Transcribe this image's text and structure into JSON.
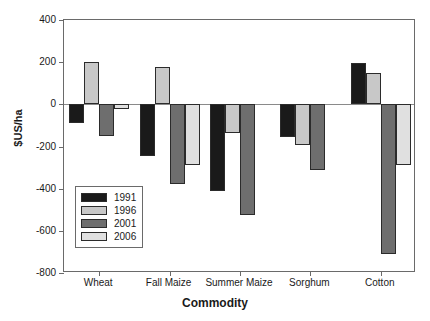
{
  "chart_data": {
    "type": "bar",
    "title": "",
    "xlabel": "Commodity",
    "ylabel": "$US/ha",
    "ylim": [
      -800,
      400
    ],
    "yticks": [
      400,
      200,
      0,
      -200,
      -400,
      -600,
      -800
    ],
    "ytick_labels": [
      "400",
      "200",
      "0",
      "-200",
      "-400",
      "-600",
      "-800"
    ],
    "grid": false,
    "legend_position": "inside-lower-left",
    "categories": [
      "Wheat",
      "Fall Maize",
      "Summer Maize",
      "Sorghum",
      "Cotton"
    ],
    "series": [
      {
        "name": "1991",
        "color": "#1a1a1a",
        "values": [
          -90,
          -245,
          -410,
          -155,
          195
        ]
      },
      {
        "name": "1996",
        "color": "#c8c8c8",
        "values": [
          200,
          175,
          -135,
          -195,
          150
        ]
      },
      {
        "name": "2001",
        "color": "#6e6e6e",
        "values": [
          -150,
          -380,
          -525,
          -310,
          -710
        ]
      },
      {
        "name": "2006",
        "color": "#e0e0e0",
        "values": [
          -20,
          -290,
          0,
          0,
          -290
        ]
      }
    ]
  },
  "legend": {
    "entries": [
      {
        "label": "1991"
      },
      {
        "label": "1996"
      },
      {
        "label": "2001"
      },
      {
        "label": "2006"
      }
    ]
  },
  "colors": {
    "axis": "#6a6a6a",
    "zero_line": "#8a8a8a",
    "bar_outline": "#2b2b2b",
    "text": "#1a1a1a",
    "background": "#ffffff"
  }
}
